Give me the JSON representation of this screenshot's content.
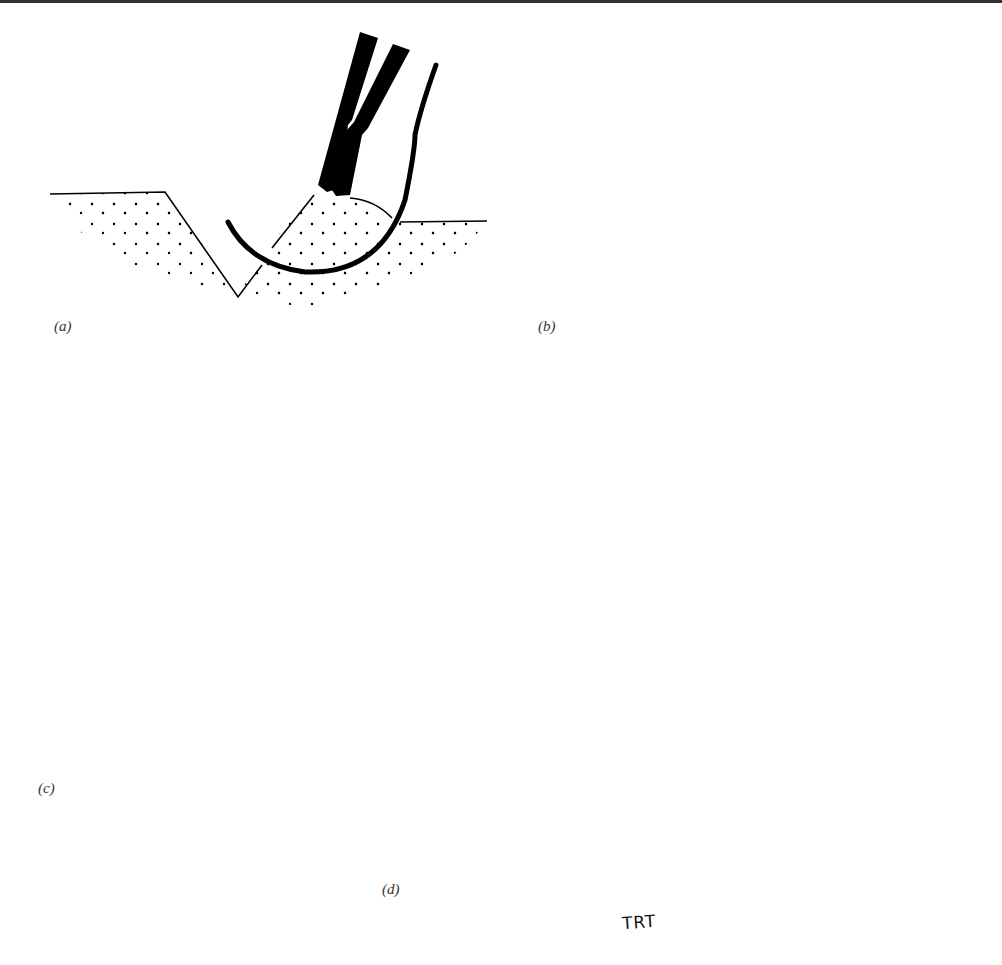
{
  "figure": {
    "type": "surgical-suture-illustration",
    "panels": [
      {
        "id": "a",
        "label": "(a)",
        "description": "Needle holder driving curved needle through wound edge"
      },
      {
        "id": "b",
        "label": "(b)",
        "description": "Needle passed through both edges with suture loop"
      },
      {
        "id": "c",
        "label": "(c)",
        "description": "Knot tied closing the wound"
      },
      {
        "id": "d",
        "label": "(d)",
        "description": "Suture cut with scissors after knot placement"
      }
    ],
    "signature": "TRT",
    "colors": {
      "ink": "#000000",
      "background": "#ffffff",
      "label": "#333333"
    }
  }
}
